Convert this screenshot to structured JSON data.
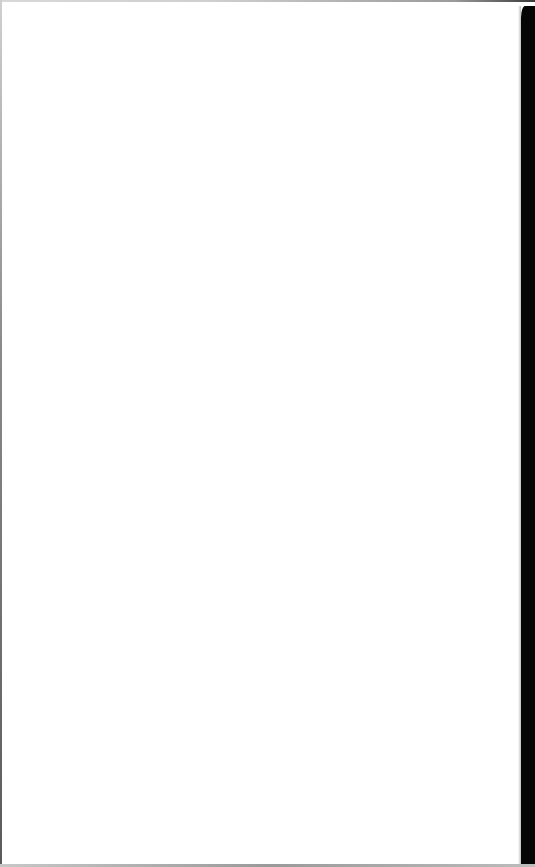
{
  "window": {
    "state": "blank",
    "background_color": "#ffffff",
    "right_edge_color": "#050505",
    "border_color": "#9a9a9a"
  },
  "page": {
    "content": ""
  }
}
